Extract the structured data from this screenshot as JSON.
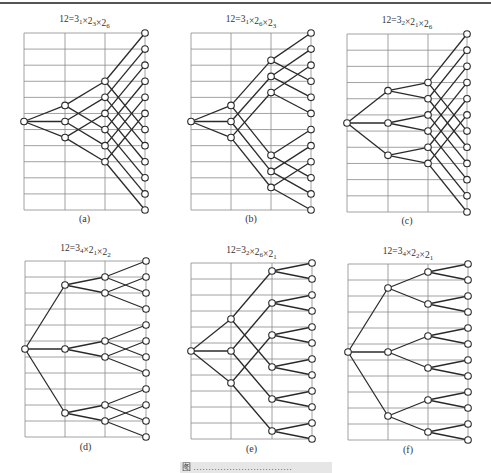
{
  "figure": {
    "caption": "图 ……………………………",
    "panels": [
      {
        "id": "a",
        "label": "(a)",
        "title": {
          "prefix": "12=3",
          "s1": "1",
          "m2": "×2",
          "s2": "3",
          "m3": "×2",
          "s3": "6"
        },
        "origin": {
          "x": 24,
          "y": 33
        },
        "cols": [
          24,
          65,
          105,
          145
        ],
        "bottom": 210,
        "levels": [
          [
            5.5
          ],
          [
            4.5,
            5.5,
            6.5
          ],
          [
            3,
            4,
            5,
            6,
            7,
            8
          ],
          [
            0,
            1,
            2,
            3,
            4,
            5,
            6,
            7,
            8,
            9,
            10,
            11
          ]
        ],
        "edges": [
          [
            [
              0,
              0
            ],
            [
              0,
              1
            ],
            [
              0,
              2
            ]
          ],
          [
            [
              0,
              0
            ],
            [
              0,
              3
            ],
            [
              1,
              1
            ],
            [
              1,
              4
            ],
            [
              2,
              2
            ],
            [
              2,
              5
            ]
          ],
          [
            [
              0,
              0
            ],
            [
              0,
              6
            ],
            [
              1,
              1
            ],
            [
              1,
              7
            ],
            [
              2,
              2
            ],
            [
              2,
              8
            ],
            [
              3,
              3
            ],
            [
              3,
              9
            ],
            [
              4,
              4
            ],
            [
              4,
              10
            ],
            [
              5,
              5
            ],
            [
              5,
              11
            ]
          ]
        ],
        "label_y": 222,
        "title_y": 22
      },
      {
        "id": "b",
        "label": "(b)",
        "title": {
          "prefix": "12=3",
          "s1": "1",
          "m2": "×2",
          "s2": "6",
          "m3": "×2",
          "s3": "3"
        },
        "origin": {
          "x": 191,
          "y": 33
        },
        "cols": [
          191,
          231,
          271,
          311
        ],
        "bottom": 210,
        "levels": [
          [
            5.5
          ],
          [
            4.5,
            5.5,
            6.5
          ],
          [
            1.7,
            2.7,
            3.7,
            7.6,
            8.6,
            9.6
          ],
          [
            0,
            1,
            2,
            3,
            4,
            5,
            6,
            7,
            8,
            9,
            10,
            11
          ]
        ],
        "edges": [
          [
            [
              0,
              0
            ],
            [
              0,
              1
            ],
            [
              0,
              2
            ]
          ],
          [
            [
              0,
              0
            ],
            [
              0,
              3
            ],
            [
              1,
              1
            ],
            [
              1,
              4
            ],
            [
              2,
              2
            ],
            [
              2,
              5
            ]
          ],
          [
            [
              0,
              0
            ],
            [
              0,
              3
            ],
            [
              1,
              1
            ],
            [
              1,
              4
            ],
            [
              2,
              2
            ],
            [
              2,
              5
            ],
            [
              3,
              6
            ],
            [
              3,
              9
            ],
            [
              4,
              7
            ],
            [
              4,
              10
            ],
            [
              5,
              8
            ],
            [
              5,
              11
            ]
          ]
        ],
        "label_y": 222,
        "title_y": 22
      },
      {
        "id": "c",
        "label": "(c)",
        "title": {
          "prefix": "12=3",
          "s1": "2",
          "m2": "×2",
          "s2": "1",
          "m3": "×2",
          "s3": "6"
        },
        "origin": {
          "x": 347,
          "y": 34
        },
        "cols": [
          347,
          388,
          428,
          467
        ],
        "bottom": 212,
        "levels": [
          [
            5.5
          ],
          [
            3.5,
            5.5,
            7.5
          ],
          [
            3,
            4,
            5,
            6,
            7,
            8
          ],
          [
            0,
            1,
            2,
            3,
            4,
            5,
            6,
            7,
            8,
            9,
            10,
            11
          ]
        ],
        "edges": [
          [
            [
              0,
              0
            ],
            [
              0,
              1
            ],
            [
              0,
              2
            ]
          ],
          [
            [
              0,
              0
            ],
            [
              0,
              1
            ],
            [
              1,
              2
            ],
            [
              1,
              3
            ],
            [
              2,
              4
            ],
            [
              2,
              5
            ]
          ],
          [
            [
              0,
              0
            ],
            [
              0,
              6
            ],
            [
              1,
              1
            ],
            [
              1,
              7
            ],
            [
              2,
              2
            ],
            [
              2,
              8
            ],
            [
              3,
              3
            ],
            [
              3,
              9
            ],
            [
              4,
              4
            ],
            [
              4,
              10
            ],
            [
              5,
              5
            ],
            [
              5,
              11
            ]
          ]
        ],
        "label_y": 224,
        "title_y": 23
      },
      {
        "id": "d",
        "label": "(d)",
        "title": {
          "prefix": "12=3",
          "s1": "4",
          "m2": "×2",
          "s2": "1",
          "m3": "×2",
          "s3": "2"
        },
        "origin": {
          "x": 25,
          "y": 261
        },
        "cols": [
          25,
          65,
          105,
          146
        ],
        "bottom": 437,
        "levels": [
          [
            5.5
          ],
          [
            1.5,
            5.5,
            9.5
          ],
          [
            1,
            2,
            5,
            6,
            9,
            10
          ],
          [
            0,
            1,
            2,
            3,
            4,
            5,
            6,
            7,
            8,
            9,
            10,
            11
          ]
        ],
        "edges": [
          [
            [
              0,
              0
            ],
            [
              0,
              1
            ],
            [
              0,
              2
            ]
          ],
          [
            [
              0,
              0
            ],
            [
              0,
              1
            ],
            [
              1,
              2
            ],
            [
              1,
              3
            ],
            [
              2,
              4
            ],
            [
              2,
              5
            ]
          ],
          [
            [
              0,
              0
            ],
            [
              0,
              2
            ],
            [
              1,
              1
            ],
            [
              1,
              3
            ],
            [
              2,
              4
            ],
            [
              2,
              6
            ],
            [
              3,
              5
            ],
            [
              3,
              7
            ],
            [
              4,
              8
            ],
            [
              4,
              10
            ],
            [
              5,
              9
            ],
            [
              5,
              11
            ]
          ]
        ],
        "label_y": 450,
        "title_y": 251
      },
      {
        "id": "e",
        "label": "(e)",
        "title": {
          "prefix": "12=3",
          "s1": "2",
          "m2": "×2",
          "s2": "6",
          "m3": "×2",
          "s3": "1"
        },
        "origin": {
          "x": 191,
          "y": 263
        },
        "cols": [
          191,
          231,
          272,
          312
        ],
        "bottom": 439,
        "levels": [
          [
            5.5
          ],
          [
            3.5,
            5.5,
            7.5
          ],
          [
            0.5,
            2.5,
            4.5,
            6.5,
            8.5,
            10.5
          ],
          [
            0,
            1,
            2,
            3,
            4,
            5,
            6,
            7,
            8,
            9,
            10,
            11
          ]
        ],
        "edges": [
          [
            [
              0,
              0
            ],
            [
              0,
              1
            ],
            [
              0,
              2
            ]
          ],
          [
            [
              0,
              0
            ],
            [
              0,
              3
            ],
            [
              1,
              1
            ],
            [
              1,
              4
            ],
            [
              2,
              2
            ],
            [
              2,
              5
            ]
          ],
          [
            [
              0,
              0
            ],
            [
              0,
              1
            ],
            [
              1,
              2
            ],
            [
              1,
              3
            ],
            [
              2,
              4
            ],
            [
              2,
              5
            ],
            [
              3,
              6
            ],
            [
              3,
              7
            ],
            [
              4,
              8
            ],
            [
              4,
              9
            ],
            [
              5,
              10
            ],
            [
              5,
              11
            ]
          ]
        ],
        "label_y": 452,
        "title_y": 253
      },
      {
        "id": "f",
        "label": "(f)",
        "title": {
          "prefix": "12=3",
          "s1": "4",
          "m2": "×2",
          "s2": "2",
          "m3": "×2",
          "s3": "1"
        },
        "origin": {
          "x": 348,
          "y": 264
        },
        "cols": [
          348,
          388,
          428,
          468
        ],
        "bottom": 440,
        "levels": [
          [
            5.5
          ],
          [
            1.5,
            5.5,
            9.5
          ],
          [
            0.5,
            2.5,
            4.5,
            6.5,
            8.5,
            10.5
          ],
          [
            0,
            1,
            2,
            3,
            4,
            5,
            6,
            7,
            8,
            9,
            10,
            11
          ]
        ],
        "edges": [
          [
            [
              0,
              0
            ],
            [
              0,
              1
            ],
            [
              0,
              2
            ]
          ],
          [
            [
              0,
              0
            ],
            [
              0,
              1
            ],
            [
              1,
              2
            ],
            [
              1,
              3
            ],
            [
              2,
              4
            ],
            [
              2,
              5
            ]
          ],
          [
            [
              0,
              0
            ],
            [
              0,
              1
            ],
            [
              1,
              2
            ],
            [
              1,
              3
            ],
            [
              2,
              4
            ],
            [
              2,
              5
            ],
            [
              3,
              6
            ],
            [
              3,
              7
            ],
            [
              4,
              8
            ],
            [
              4,
              9
            ],
            [
              5,
              10
            ],
            [
              5,
              11
            ]
          ]
        ],
        "label_y": 453,
        "title_y": 254
      }
    ]
  }
}
